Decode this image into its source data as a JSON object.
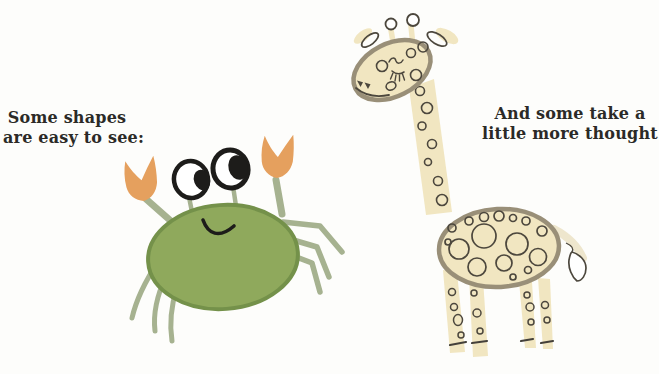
{
  "captions": {
    "left": {
      "line1": "Some shapes",
      "line2": "are easy to see:"
    },
    "right": {
      "line1": "And some take a",
      "line2": "little more thought:"
    }
  },
  "colors": {
    "background": "#fdfdfb",
    "text": "#2b2a27",
    "ink": "#1d1c1a",
    "crab_body": "#8fa95c",
    "crab_outline": "#74914a",
    "crab_limb": "#a6b290",
    "crab_claw": "#e5a05e",
    "giraffe_fill": "#f1e6c1",
    "giraffe_outline": "#998f78",
    "giraffe_ink": "#4c473d",
    "hoof": "#44403a",
    "tail": "#eae0c2"
  }
}
